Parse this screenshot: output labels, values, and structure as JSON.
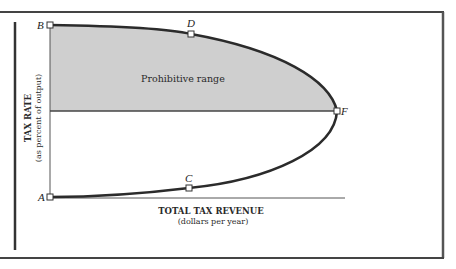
{
  "diagram": {
    "region_label": "Prohibitive range",
    "y_axis": {
      "label": "TAX RATE",
      "sublabel": "(as percent of output)"
    },
    "x_axis": {
      "label": "TOTAL TAX REVENUE",
      "sublabel": "(dollars per year)"
    },
    "points": [
      {
        "id": "B",
        "label": "B"
      },
      {
        "id": "D",
        "label": "D"
      },
      {
        "id": "F",
        "label": "F"
      },
      {
        "id": "C",
        "label": "C"
      },
      {
        "id": "A",
        "label": "A"
      }
    ],
    "colors": {
      "shade": "#cfcfcf",
      "curve": "#2b2b2b",
      "frame": "#555555"
    }
  }
}
